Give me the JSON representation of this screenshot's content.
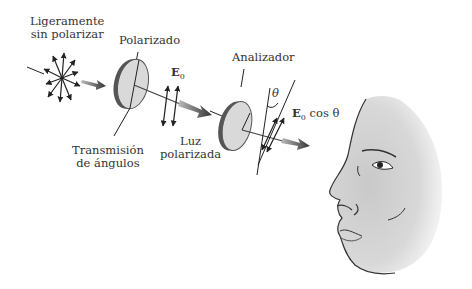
{
  "diagram": {
    "labels": {
      "unpolarized": [
        "Ligeramente",
        "sin polarizar"
      ],
      "polarizer": "Polarizado",
      "transmission_axis": [
        "Transmisión",
        "de ángulos"
      ],
      "field_amplitude": "E",
      "field_subscript": "0",
      "polarized_light": [
        "Luz",
        "polarizada"
      ],
      "analyzer": "Analizador",
      "angle": "θ",
      "transmitted_amplitude_prefix": "E",
      "transmitted_amplitude_subscript": "0",
      "transmitted_amplitude_suffix": " cos θ"
    },
    "colors": {
      "disk_face": "#d9d9d9",
      "disk_edge": "#555555",
      "arrow": "#222222",
      "beam_arrow": "#444444",
      "skin": "#cfcfcf"
    }
  }
}
